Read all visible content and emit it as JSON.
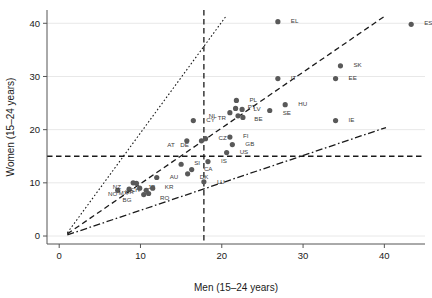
{
  "chart_data": {
    "type": "scatter",
    "title": "",
    "xlabel": "Men (15–24 years)",
    "ylabel": "Women (15–24 years)",
    "xlim": [
      -1.5,
      45
    ],
    "ylim": [
      -1.5,
      42.5
    ],
    "xticks": [
      0,
      10,
      20,
      30,
      40
    ],
    "yticks": [
      0,
      10,
      20,
      30,
      40
    ],
    "xtick_labels": [
      "0",
      "10",
      "20",
      "30",
      "40"
    ],
    "ytick_labels": [
      "0",
      "10",
      "20",
      "30",
      "40"
    ],
    "grid": "horizontal-light",
    "legend": "none",
    "marker_color": "#595959",
    "line_color": "#1a1a1a",
    "reference_lines": [
      {
        "name": "vertical-reference",
        "orientation": "vertical",
        "value": 17.8,
        "style": "dashed"
      },
      {
        "name": "horizontal-reference",
        "orientation": "horizontal",
        "value": 15.0,
        "style": "dashed"
      },
      {
        "name": "upper-ratio-line",
        "style": "dotted",
        "x1": 1.0,
        "y1": 0.6,
        "x2": 20.6,
        "y2": 41.5
      },
      {
        "name": "equality-line",
        "style": "dashed",
        "x1": 1.0,
        "y1": 0.4,
        "x2": 40.2,
        "y2": 41.5
      },
      {
        "name": "lower-ratio-line",
        "style": "dash-dot",
        "x1": 1.0,
        "y1": 0.2,
        "x2": 40.2,
        "y2": 20.4
      }
    ],
    "points": [
      {
        "label": "EL",
        "x": 26.9,
        "y": 40.3,
        "label_dx": 1.6,
        "label_dy": 0.2
      },
      {
        "label": "ES",
        "x": 43.3,
        "y": 39.8,
        "label_dx": 1.6,
        "label_dy": 0.2
      },
      {
        "label": "SK",
        "x": 34.6,
        "y": 32.0,
        "label_dx": 1.6,
        "label_dy": 0.2
      },
      {
        "label": "EE",
        "x": 34.0,
        "y": 29.6,
        "label_dx": 1.6,
        "label_dy": 0.2
      },
      {
        "label": "IT",
        "x": 26.9,
        "y": 29.6,
        "label_dx": 1.6,
        "label_dy": 0.2
      },
      {
        "label": "HU",
        "x": 27.8,
        "y": 24.7,
        "label_dx": 1.6,
        "label_dy": 0.2
      },
      {
        "label": "SE",
        "x": 25.9,
        "y": 23.6,
        "label_dx": 1.6,
        "label_dy": -0.4
      },
      {
        "label": "IE",
        "x": 34.0,
        "y": 21.7,
        "label_dx": 1.6,
        "label_dy": 0.2
      },
      {
        "label": "PL",
        "x": 21.8,
        "y": 25.5,
        "label_dx": 1.6,
        "label_dy": 0.2
      },
      {
        "label": "PT",
        "x": 21.7,
        "y": 24.0,
        "label_dx": 1.5,
        "label_dy": 0.3
      },
      {
        "label": "LV",
        "x": 22.5,
        "y": 23.8,
        "label_dx": 1.4,
        "label_dy": 0.1
      },
      {
        "label": "NL",
        "x": 21.0,
        "y": 23.2,
        "label_dx": -2.6,
        "label_dy": -0.6
      },
      {
        "label": "TR",
        "x": 22.0,
        "y": 22.6,
        "label_dx": -2.5,
        "label_dy": -0.4
      },
      {
        "label": "BE",
        "x": 22.6,
        "y": 22.3,
        "label_dx": 1.4,
        "label_dy": -0.3
      },
      {
        "label": "CY",
        "x": 16.5,
        "y": 21.7,
        "label_dx": 1.6,
        "label_dy": 0.2
      },
      {
        "label": "FI",
        "x": 21.0,
        "y": 18.6,
        "label_dx": 1.6,
        "label_dy": 0.2
      },
      {
        "label": "GB",
        "x": 21.3,
        "y": 17.2,
        "label_dx": 1.6,
        "label_dy": 0.2
      },
      {
        "label": "US",
        "x": 20.6,
        "y": 15.7,
        "label_dx": 1.6,
        "label_dy": 0.2
      },
      {
        "label": "CZ",
        "x": 18.0,
        "y": 18.3,
        "label_dx": 1.6,
        "label_dy": 0.2
      },
      {
        "label": "DE",
        "x": 17.5,
        "y": 17.9,
        "label_dx": -2.6,
        "label_dy": -0.7
      },
      {
        "label": "AT",
        "x": 15.7,
        "y": 17.9,
        "label_dx": -2.4,
        "label_dy": -0.7
      },
      {
        "label": "IS",
        "x": 18.3,
        "y": 14.0,
        "label_dx": 1.6,
        "label_dy": 0.2
      },
      {
        "label": "SI",
        "x": 15.0,
        "y": 13.5,
        "label_dx": 1.6,
        "label_dy": 0.2
      },
      {
        "label": "CA",
        "x": 16.3,
        "y": 12.5,
        "label_dx": 1.5,
        "label_dy": 0.1
      },
      {
        "label": "DK",
        "x": 15.8,
        "y": 11.7,
        "label_dx": 1.5,
        "label_dy": -0.5
      },
      {
        "label": "LU",
        "x": 17.8,
        "y": 10.2,
        "label_dx": 1.6,
        "label_dy": 0.0
      },
      {
        "label": "AU",
        "x": 12.0,
        "y": 11.0,
        "label_dx": 1.6,
        "label_dy": 0.2
      },
      {
        "label": "CH",
        "x": 7.2,
        "y": 8.6,
        "label_dx": 1.6,
        "label_dy": 0.0
      },
      {
        "label": "NZ",
        "x": 9.1,
        "y": 10.0,
        "label_dx": -2.5,
        "label_dy": -0.8
      },
      {
        "label": "JP",
        "x": 9.5,
        "y": 9.9,
        "label_dx": 1.4,
        "label_dy": -0.6
      },
      {
        "label": "NO",
        "x": 8.6,
        "y": 8.8,
        "label_dx": -2.6,
        "label_dy": -0.8
      },
      {
        "label": "MX",
        "x": 9.9,
        "y": 9.0,
        "label_dx": -2.6,
        "label_dy": -0.9
      },
      {
        "label": "KR",
        "x": 11.5,
        "y": 9.0,
        "label_dx": 1.5,
        "label_dy": 0.2
      },
      {
        "label": "RO",
        "x": 11.0,
        "y": 8.0,
        "label_dx": 1.4,
        "label_dy": -0.8
      },
      {
        "label": "BG",
        "x": 10.4,
        "y": 7.8,
        "label_dx": -2.6,
        "label_dy": -0.9
      },
      {
        "label": "HR",
        "x": 10.7,
        "y": 8.6,
        "label_dx": -2.6,
        "label_dy": -0.2
      }
    ]
  }
}
